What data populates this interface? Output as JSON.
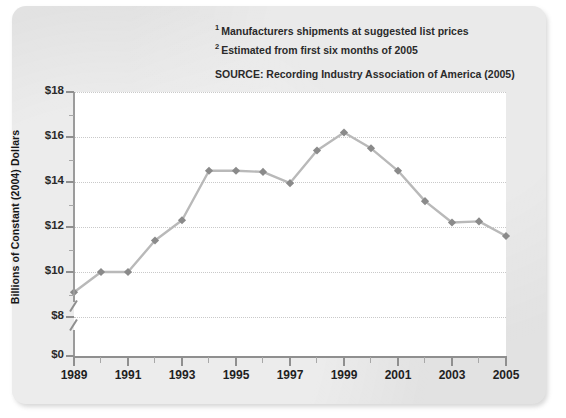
{
  "figure": {
    "footnotes": [
      {
        "marker": "1",
        "text": "Manufacturers shipments at suggested list prices"
      },
      {
        "marker": "2",
        "text": "Estimated from first six months of 2005"
      }
    ],
    "source": "SOURCE: Recording Industry Association of America (2005)",
    "colors": {
      "panel_background": "#e2e2e2",
      "plot_background": "#ffffff",
      "line": "#b9b9b9",
      "marker": "#8a8a8a",
      "axis": "#8f8f8f",
      "gridline": "#c9c9c9",
      "text": "#1f1f1f"
    }
  },
  "chart_data": {
    "type": "line",
    "title": "",
    "subtitle": "",
    "xlabel": "",
    "ylabel": "Billions of Constant (2004) Dollars",
    "ylim": [
      8,
      18
    ],
    "y_axis_break": true,
    "y_break_label": "$0",
    "ytick_labels": [
      "$18",
      "$16",
      "$14",
      "$12",
      "$10",
      "$8",
      "$0"
    ],
    "ytick_values": [
      18,
      16,
      14,
      12,
      10,
      8,
      0
    ],
    "xlim": [
      1989,
      2005
    ],
    "xtick_labels": [
      "1989",
      "1991",
      "1993",
      "1995",
      "1997",
      "1999",
      "2001",
      "2003",
      "2005"
    ],
    "xtick_values": [
      1989,
      1991,
      1993,
      1995,
      1997,
      1999,
      2001,
      2003,
      2005
    ],
    "grid": true,
    "legend": "none",
    "marker_shape": "diamond",
    "x": [
      1989,
      1990,
      1991,
      1992,
      1993,
      1994,
      1995,
      1996,
      1997,
      1998,
      1999,
      2000,
      2001,
      2002,
      2003,
      2004,
      2005
    ],
    "series": [
      {
        "name": "Recorded music shipments",
        "values": [
          9.1,
          10.0,
          10.0,
          11.4,
          12.3,
          14.5,
          14.5,
          14.45,
          13.95,
          15.4,
          16.2,
          15.5,
          14.5,
          13.15,
          12.2,
          12.25,
          11.6
        ]
      }
    ]
  }
}
